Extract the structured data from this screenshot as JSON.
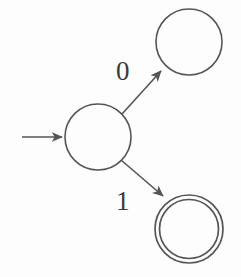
{
  "figure": {
    "name": "finite-state-machine-diagram",
    "type": "state-transition-diagram",
    "background_color": "#fdfdfd",
    "stroke_color": "#555555",
    "text_color": "#3a3a3a",
    "width": 241,
    "height": 277
  },
  "states": [
    {
      "id": "start-state",
      "label": "",
      "shape": "circle",
      "accepting": false,
      "is_start": true,
      "cx": 98,
      "cy": 137,
      "r": 33
    },
    {
      "id": "state-top",
      "label": "",
      "shape": "circle",
      "accepting": false,
      "is_start": false,
      "cx": 189,
      "cy": 42,
      "r": 33
    },
    {
      "id": "state-accepting",
      "label": "",
      "shape": "double-circle",
      "accepting": true,
      "is_start": false,
      "cx": 189,
      "cy": 229,
      "r": 34,
      "r_inner": 29.5
    }
  ],
  "transitions": [
    {
      "id": "start-arrow",
      "from": null,
      "to": "start-state",
      "label": "",
      "x1": 22,
      "y1": 137,
      "x2": 63,
      "y2": 137
    },
    {
      "id": "transition-zero",
      "from": "start-state",
      "to": "state-top",
      "label": "0",
      "x1": 122,
      "y1": 114,
      "x2": 163,
      "y2": 69
    },
    {
      "id": "transition-one",
      "from": "start-state",
      "to": "state-accepting",
      "label": "1",
      "x1": 121,
      "y1": 160,
      "x2": 165,
      "y2": 198
    }
  ],
  "labels": {
    "zero": "0",
    "one": "1"
  }
}
